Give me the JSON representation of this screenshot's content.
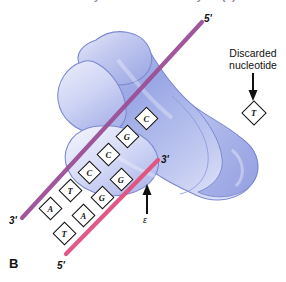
{
  "figure": {
    "panel_label": "B",
    "cropped_title_fragment": "DNA Polymerase III Holoenzyme (?)"
  },
  "colors": {
    "template_strand": "#9b4f96",
    "nascent_strand": "#e2527f",
    "protein_fill_light": "#c8cdf0",
    "protein_fill_mid": "#a8b2e8",
    "protein_fill_deep": "#8e9ade",
    "protein_outline": "#6d7ac4",
    "nucleotide_box": "#ffffff",
    "ink": "#111111"
  },
  "strands": {
    "template": {
      "name": "template-strand",
      "five_prime_label": "5'",
      "three_prime_label": "3'",
      "bases": [
        "A",
        "T",
        "C",
        "C",
        "G",
        "C"
      ]
    },
    "nascent": {
      "name": "nascent-strand",
      "five_prime_label": "5'",
      "three_prime_label": "3'",
      "bases": [
        "T",
        "A",
        "G",
        "G"
      ]
    }
  },
  "annotations": {
    "discarded_nucleotide": {
      "label_line1": "Discarded",
      "label_line2": "nucleotide",
      "base": "T"
    },
    "epsilon_subunit": {
      "label": "ε"
    }
  },
  "protein": {
    "name": "dna-polymerase-blob",
    "description": "clamp-shaped polymerase body"
  }
}
